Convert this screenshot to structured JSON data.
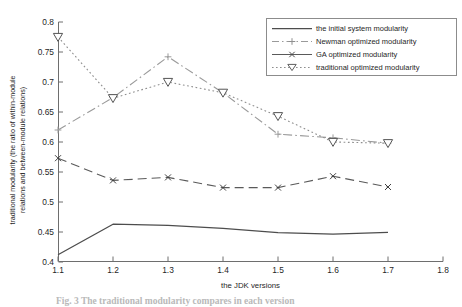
{
  "chart_data": {
    "type": "line",
    "title": "",
    "xlabel": "the JDK versions",
    "ylabel_line1": "traditional modularity (the ratio of within-module",
    "ylabel_line2": "relations and between-module relations)",
    "x": [
      1.1,
      1.2,
      1.3,
      1.4,
      1.5,
      1.6,
      1.7
    ],
    "xlim": [
      1.1,
      1.8
    ],
    "ylim": [
      0.4,
      0.8
    ],
    "xticks": [
      "1.1",
      "1.2",
      "1.3",
      "1.4",
      "1.5",
      "1.6",
      "1.7",
      "1.8"
    ],
    "xtick_values": [
      1.1,
      1.2,
      1.3,
      1.4,
      1.5,
      1.6,
      1.7,
      1.8
    ],
    "yticks": [
      "0.4",
      "0.45",
      "0.5",
      "0.55",
      "0.6",
      "0.65",
      "0.7",
      "0.75",
      "0.8"
    ],
    "ytick_values": [
      0.4,
      0.45,
      0.5,
      0.55,
      0.6,
      0.65,
      0.7,
      0.75,
      0.8
    ],
    "grid": false,
    "legend_position": "upper-right",
    "series": [
      {
        "name": "the initial system modularity",
        "style": "solid",
        "marker": "none",
        "color": "#4d4d4d",
        "values": [
          0.412,
          0.463,
          0.461,
          0.456,
          0.449,
          0.4465,
          0.4495
        ]
      },
      {
        "name": "Newman optimized modularity",
        "style": "dash-dot",
        "marker": "plus",
        "color": "#9a9a9a",
        "values": [
          0.62,
          0.674,
          0.742,
          0.682,
          0.613,
          0.607,
          0.598
        ]
      },
      {
        "name": "GA optimized modularity",
        "style": "dashed",
        "marker": "cross",
        "color": "#5a5a5a",
        "values": [
          0.573,
          0.536,
          0.541,
          0.524,
          0.524,
          0.543,
          0.525
        ]
      },
      {
        "name": "traditional optimized modularity",
        "style": "dotted",
        "marker": "triangle-down",
        "color": "#8e8e8e",
        "values": [
          0.775,
          0.673,
          0.7,
          0.682,
          0.643,
          0.6,
          0.598
        ]
      }
    ]
  },
  "legend": {
    "items": [
      {
        "label": "the initial system modularity",
        "icon": "solid-line-icon"
      },
      {
        "label": "Newman optimized modularity",
        "icon": "dash-dot-plus-line-icon"
      },
      {
        "label": "GA optimized modularity",
        "icon": "solid-cross-line-icon"
      },
      {
        "label": "traditional optimized modularity",
        "icon": "dotted-triangle-line-icon"
      }
    ]
  },
  "caption": "Fig. 3  The traditional modularity compares in each version"
}
